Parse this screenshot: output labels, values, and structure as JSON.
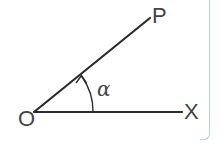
{
  "diagram": {
    "type": "angle",
    "labels": {
      "vertex": "O",
      "initial_side_end": "X",
      "terminal_side_end": "P",
      "angle": "α"
    },
    "rays": [
      {
        "from": "O",
        "to": "X",
        "direction": "horizontal"
      },
      {
        "from": "O",
        "to": "P",
        "direction": "up-right"
      }
    ],
    "arc": {
      "from": "OX",
      "to": "OP",
      "arrowhead": "at OP",
      "label": "α"
    },
    "colors": {
      "line": "#2b2b2b",
      "label": "#444444",
      "frame_border": "#a9d3e6",
      "background": "#ffffff"
    }
  }
}
